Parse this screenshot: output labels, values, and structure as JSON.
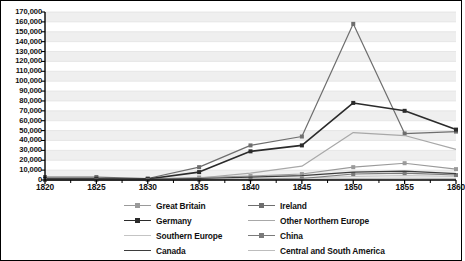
{
  "chart_data": {
    "type": "line",
    "title": "",
    "subtitle": "",
    "xlabel": "",
    "ylabel": "",
    "x": [
      1820,
      1825,
      1830,
      1835,
      1840,
      1845,
      1850,
      1855,
      1860
    ],
    "xtick_labels": [
      "1820",
      "1825",
      "1830",
      "1835",
      "1840",
      "1845",
      "1850",
      "1855",
      "1860"
    ],
    "ytick_labels": [
      "170,000",
      "160,000",
      "150,000",
      "140,000",
      "130,000",
      "120,000",
      "110,000",
      "100,000",
      "90,000",
      "80,000",
      "70,000",
      "60,000",
      "50,000",
      "40,000",
      "30,000",
      "20,000",
      "10,000",
      "0"
    ],
    "ytick_values": [
      170000,
      160000,
      150000,
      140000,
      130000,
      120000,
      110000,
      100000,
      90000,
      80000,
      70000,
      60000,
      50000,
      40000,
      30000,
      20000,
      10000,
      0
    ],
    "ylim": [
      0,
      170000
    ],
    "xlim": [
      1820,
      1860
    ],
    "grid": true,
    "grid_orientation": "horizontal",
    "legend_position": "bottom",
    "legend_columns": 2,
    "series": [
      {
        "name": "Great Britain",
        "color": "#9a9a9a",
        "marker": "square",
        "width": 1.1,
        "values": [
          1500,
          1500,
          1200,
          2500,
          4000,
          6000,
          13000,
          17000,
          11000
        ]
      },
      {
        "name": "Ireland",
        "color": "#6e6e6e",
        "marker": "square",
        "width": 1.2,
        "values": [
          3000,
          3000,
          1500,
          13000,
          35000,
          44000,
          158000,
          47000,
          49000
        ]
      },
      {
        "name": "Germany",
        "color": "#2b2b2b",
        "marker": "square",
        "width": 1.6,
        "values": [
          1200,
          1200,
          1000,
          8000,
          29000,
          35000,
          78000,
          70000,
          51000
        ]
      },
      {
        "name": "Other Northern Europe",
        "color": "#a8a8a8",
        "marker": "none",
        "width": 1.2,
        "values": [
          600,
          600,
          500,
          2000,
          7000,
          14000,
          48000,
          45000,
          31000
        ]
      },
      {
        "name": "Southern Europe",
        "color": "#c4c4c4",
        "marker": "none",
        "width": 1.1,
        "values": [
          300,
          300,
          300,
          600,
          1200,
          2000,
          3500,
          4500,
          3500
        ]
      },
      {
        "name": "China",
        "color": "#7a7a7a",
        "marker": "square",
        "width": 1.1,
        "values": [
          100,
          100,
          100,
          300,
          800,
          1500,
          6000,
          7000,
          5000
        ]
      },
      {
        "name": "Canada",
        "color": "#3d3d3d",
        "marker": "none",
        "width": 1.2,
        "values": [
          800,
          800,
          700,
          1500,
          3000,
          4500,
          8000,
          9000,
          6500
        ]
      },
      {
        "name": "Central and South America",
        "color": "#bdbdbd",
        "marker": "none",
        "width": 1.1,
        "values": [
          200,
          200,
          200,
          300,
          500,
          800,
          1500,
          1800,
          1400
        ]
      }
    ]
  },
  "legend": {
    "items": [
      {
        "label": "Great Britain",
        "color": "#9a9a9a",
        "marker": "square",
        "width": 1.1
      },
      {
        "label": "Ireland",
        "color": "#6e6e6e",
        "marker": "square",
        "width": 1.2
      },
      {
        "label": "Germany",
        "color": "#2b2b2b",
        "marker": "square",
        "width": 1.6
      },
      {
        "label": "Other Northern Europe",
        "color": "#a8a8a8",
        "marker": "none",
        "width": 1.2
      },
      {
        "label": "Southern Europe",
        "color": "#c4c4c4",
        "marker": "none",
        "width": 1.1
      },
      {
        "label": "China",
        "color": "#7a7a7a",
        "marker": "square",
        "width": 1.1
      },
      {
        "label": "Canada",
        "color": "#3d3d3d",
        "marker": "none",
        "width": 1.2
      },
      {
        "label": "Central and South America",
        "color": "#bdbdbd",
        "marker": "none",
        "width": 1.1
      }
    ]
  },
  "style": {
    "plot_background": "#ffffff",
    "band_color": "#efefef",
    "grid_color": "#e2e2e2",
    "axis_color": "#000000",
    "frame_color": "#000000",
    "text_color": "#111111"
  }
}
